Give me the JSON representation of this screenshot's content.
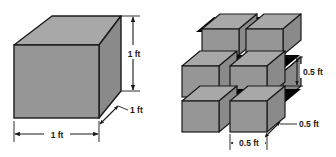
{
  "figure": {
    "background_color": "#ffffff",
    "colors": {
      "face_front": "#969696",
      "face_top": "#a8a8a8",
      "face_side": "#8a8a8a",
      "outline": "#1a1a1a",
      "gap_shadow": "#000000",
      "dimension_line": "#1a1a1a",
      "text": "#1a1a1a"
    },
    "left_solid": {
      "name": "unit-cube",
      "description": "single solid cube drawn in oblique projection",
      "dimensions": {
        "height_label": "1 ft",
        "width_label": "1 ft",
        "depth_label": "1 ft"
      }
    },
    "right_solid": {
      "name": "subdivided-cube",
      "description": "same cube cut into eight smaller cubes, two layers of four",
      "count": 8,
      "dimensions": {
        "height_label": "0.5 ft",
        "width_label": "0.5 ft",
        "depth_label": "0.5 ft"
      }
    },
    "labels": {
      "left_height": "1 ft",
      "left_depth": "1 ft",
      "left_width": "1 ft",
      "right_height": "0.5 ft",
      "right_depth": "0.5 ft",
      "right_width": "0.5 ft"
    }
  }
}
